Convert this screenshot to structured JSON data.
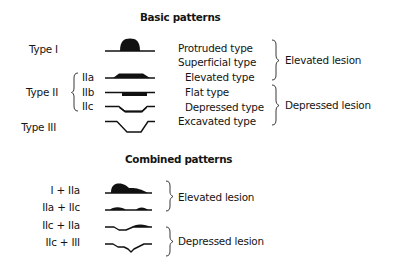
{
  "basic": {
    "title": "Basic patterns",
    "types": {
      "type1": "Type I",
      "type2": "Type II",
      "type3": "Type III"
    },
    "subtypes": [
      "IIa",
      "IIb",
      "IIc"
    ],
    "descriptions": [
      "Protruded type",
      "Superficial type",
      "Elevated type",
      "Flat type",
      "Depressed type",
      "Excavated type"
    ],
    "groups": {
      "elevated": "Elevated lesion",
      "depressed": "Depressed lesion"
    }
  },
  "combined": {
    "title": "Combined patterns",
    "patterns": [
      "I + IIa",
      "IIa + IIc",
      "IIc + IIa",
      "IIc + III"
    ],
    "groups": {
      "elevated": "Elevated lesion",
      "depressed": "Depressed lesion"
    }
  },
  "colors": {
    "ink": "#111111",
    "background": "#ffffff"
  }
}
